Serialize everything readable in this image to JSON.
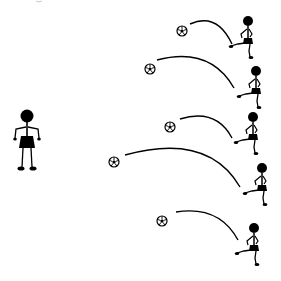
{
  "scene": {
    "title": "Soccer kicking drill illustration",
    "background": "#ffffff",
    "ink": "#000000",
    "receiver": {
      "label": "standing player",
      "head": [
        27,
        116
      ]
    },
    "kickers": [
      {
        "id": 1,
        "head": [
          248,
          21
        ],
        "ball": [
          182,
          31
        ],
        "arc": [
          [
            190,
            24
          ],
          [
            212,
            14
          ],
          [
            232,
            44
          ]
        ]
      },
      {
        "id": 2,
        "head": [
          256,
          71
        ],
        "ball": [
          150,
          69
        ],
        "arc": [
          [
            157,
            60
          ],
          [
            205,
            48
          ],
          [
            234,
            88
          ]
        ]
      },
      {
        "id": 3,
        "head": [
          253,
          117
        ],
        "ball": [
          170,
          127
        ],
        "arc": [
          [
            180,
            119
          ],
          [
            212,
            110
          ],
          [
            232,
            138
          ]
        ]
      },
      {
        "id": 4,
        "head": [
          262,
          168
        ],
        "ball": [
          114,
          162
        ],
        "arc": [
          [
            125,
            155
          ],
          [
            200,
            135
          ],
          [
            240,
            187
          ]
        ]
      },
      {
        "id": 5,
        "head": [
          254,
          228
        ],
        "ball": [
          162,
          221
        ],
        "arc": [
          [
            176,
            212
          ],
          [
            215,
            207
          ],
          [
            238,
            240
          ]
        ]
      }
    ]
  }
}
